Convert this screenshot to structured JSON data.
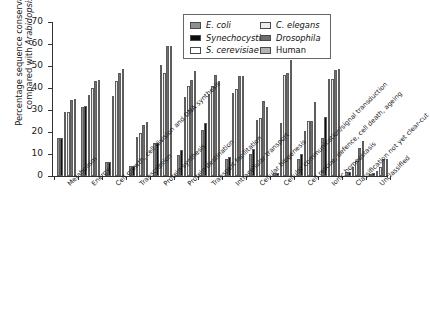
{
  "chart_data": {
    "type": "bar",
    "title": "",
    "xlabel": "",
    "ylabel": "Percentage sequence conservation compared with Arabidopsis",
    "ylim": [
      0,
      70
    ],
    "yticks": [
      0,
      10,
      20,
      30,
      40,
      50,
      60,
      70
    ],
    "grid": false,
    "legend_position": "top-right",
    "categories": [
      "Metabolism",
      "Energy",
      "Cell growth, cell division and DNA synthesis",
      "Transcription",
      "Protein synthesis",
      "Protein destination",
      "Transport facilitation",
      "Intracellular transport",
      "Cellular biogenesis",
      "Cellular communication/signal transduction",
      "Cell rescue, defence, cell death, ageing",
      "Ionic homeostasis",
      "Classification not yet clear-cut",
      "Unclassified"
    ],
    "series": [
      {
        "name": "E. coli",
        "color": "#8f8f8f",
        "values": [
          17.4,
          31.5,
          6.2,
          4.6,
          15.1,
          9.4,
          20.7,
          7.8,
          9.8,
          1.4,
          7.6,
          17.3,
          1.6,
          0.9
        ]
      },
      {
        "name": "Synechocystis",
        "color": "#0d0d0d",
        "values": [
          17.4,
          31.6,
          6.2,
          4.7,
          15.2,
          11.6,
          24.1,
          8.7,
          12.1,
          1.5,
          9.8,
          26.6,
          1.8,
          1.3
        ]
      },
      {
        "name": "S. cerevisiae",
        "color": "#ffffff",
        "values": [
          28.9,
          36.7,
          36.4,
          17.9,
          50.6,
          36.1,
          37.4,
          37.6,
          25.6,
          24.2,
          20.5,
          43.9,
          4.1,
          2.5
        ]
      },
      {
        "name": "C. elegans",
        "color": "#ebebeb",
        "values": [
          29.2,
          39.9,
          43.4,
          19.6,
          46.9,
          40.9,
          40.9,
          39.4,
          26.2,
          46.0,
          24.8,
          44.0,
          6.9,
          4.3
        ]
      },
      {
        "name": "Drosophila",
        "color": "#6e6e6e",
        "values": [
          34.4,
          43.3,
          46.9,
          23.3,
          58.9,
          43.7,
          46.0,
          45.3,
          34.2,
          46.9,
          25.1,
          48.1,
          12.6,
          7.6
        ]
      },
      {
        "name": "Human",
        "color": "#b3b3b3",
        "values": [
          34.9,
          43.6,
          48.6,
          24.7,
          58.9,
          47.8,
          43.1,
          45.4,
          31.5,
          52.7,
          33.7,
          48.7,
          15.9,
          7.8
        ]
      }
    ]
  },
  "legend": {
    "items": [
      {
        "label": "E. coli",
        "italic": true,
        "color": "#8f8f8f"
      },
      {
        "label": "Synechocystis",
        "italic": true,
        "color": "#0d0d0d"
      },
      {
        "label": "S. cerevisiae",
        "italic": true,
        "color": "#ffffff"
      },
      {
        "label": "C. elegans",
        "italic": true,
        "color": "#ebebeb"
      },
      {
        "label": "Drosophila",
        "italic": true,
        "color": "#6e6e6e"
      },
      {
        "label": "Human",
        "italic": false,
        "color": "#b3b3b3"
      }
    ]
  },
  "axis": {
    "y_title_line1": "Percentage sequence conservation",
    "y_title_line2_prefix": "compared with ",
    "y_title_line2_italic": "Arabidopsis"
  }
}
